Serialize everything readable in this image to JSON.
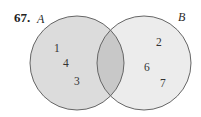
{
  "problem_number": "67.",
  "sets": {
    "A": {
      "name": "A",
      "only": [
        "1",
        "4",
        "3"
      ]
    },
    "B": {
      "name": "B",
      "only": [
        "2",
        "6",
        "7"
      ]
    },
    "intersection": [
      "5",
      "8"
    ]
  },
  "colors": {
    "background": "#ffffff",
    "circle_a_fill": "#dcdcdc",
    "circle_b_fill": "#ececec",
    "intersection_fill": "#c8c8c8",
    "stroke": "#666666"
  }
}
